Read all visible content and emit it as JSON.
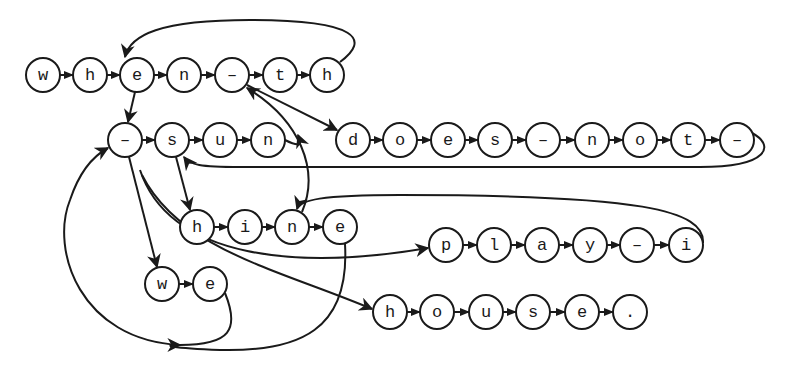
{
  "diagram": {
    "node_radius": 17,
    "colors": {
      "stroke": "#1a1a1a",
      "fill": "#ffffff",
      "background": "#ffffff"
    },
    "chains": [
      {
        "id": "chain-when-th",
        "y": 75,
        "nodes": [
          {
            "label": "w",
            "x": 43
          },
          {
            "label": "h",
            "x": 90
          },
          {
            "label": "e",
            "x": 137
          },
          {
            "label": "n",
            "x": 184
          },
          {
            "label": "-",
            "x": 232
          },
          {
            "label": "t",
            "x": 280
          },
          {
            "label": "h",
            "x": 327
          }
        ]
      },
      {
        "id": "chain-sun",
        "y": 140,
        "nodes": [
          {
            "label": "-",
            "x": 125
          },
          {
            "label": "s",
            "x": 172
          },
          {
            "label": "u",
            "x": 220
          },
          {
            "label": "n",
            "x": 268
          }
        ]
      },
      {
        "id": "chain-does-not",
        "y": 140,
        "nodes": [
          {
            "label": "d",
            "x": 353
          },
          {
            "label": "o",
            "x": 400
          },
          {
            "label": "e",
            "x": 448
          },
          {
            "label": "s",
            "x": 495
          },
          {
            "label": "-",
            "x": 543
          },
          {
            "label": "n",
            "x": 592
          },
          {
            "label": "o",
            "x": 640
          },
          {
            "label": "t",
            "x": 688
          },
          {
            "label": "-",
            "x": 737
          }
        ]
      },
      {
        "id": "chain-hine",
        "y": 227,
        "nodes": [
          {
            "label": "h",
            "x": 197
          },
          {
            "label": "i",
            "x": 245
          },
          {
            "label": "n",
            "x": 292
          },
          {
            "label": "e",
            "x": 340
          }
        ]
      },
      {
        "id": "chain-play-i",
        "y": 245,
        "nodes": [
          {
            "label": "p",
            "x": 446
          },
          {
            "label": "l",
            "x": 494
          },
          {
            "label": "a",
            "x": 542
          },
          {
            "label": "y",
            "x": 590
          },
          {
            "label": "-",
            "x": 637
          },
          {
            "label": "i",
            "x": 686
          }
        ]
      },
      {
        "id": "chain-we",
        "y": 284,
        "nodes": [
          {
            "label": "w",
            "x": 162
          },
          {
            "label": "e",
            "x": 210
          }
        ]
      },
      {
        "id": "chain-house",
        "y": 312,
        "nodes": [
          {
            "label": "h",
            "x": 390
          },
          {
            "label": "o",
            "x": 437
          },
          {
            "label": "u",
            "x": 486
          },
          {
            "label": "s",
            "x": 533
          },
          {
            "label": "e",
            "x": 582
          },
          {
            "label": ".",
            "x": 630
          }
        ]
      }
    ],
    "edges": [
      {
        "name": "edge-th-h-to-e",
        "d": "M 340 62 C 370 40, 360 20, 250 20 C 160 20, 130 35, 125 57"
      },
      {
        "name": "edge-e-to-dash-sun",
        "d": "M 135 92 L 128 122"
      },
      {
        "name": "edge-dash-to-does",
        "d": "M 247 85 L 337 130"
      },
      {
        "name": "edge-n-sun-to-dash",
        "d": "M 285 140 C 305 150, 300 140, 298 135"
      },
      {
        "name": "edge-n-hine-to-dash-th",
        "d": "M 302 212 C 320 170, 300 120, 247 88"
      },
      {
        "name": "edge-not-dash-to-s",
        "d": "M 752 133 C 775 145, 770 167, 700 167 L 240 167 C 200 167, 190 165, 184 157"
      },
      {
        "name": "edge-s-to-hine-h",
        "d": "M 176 157 L 190 210"
      },
      {
        "name": "edge-play-i-to-n",
        "d": "M 703 243 C 705 210, 640 195, 400 195 C 320 195, 300 200, 297 209"
      },
      {
        "name": "edge-dash-sun-to-we",
        "d": "M 129 157 L 157 267"
      },
      {
        "name": "edge-dash-sun-to-play",
        "d": "M 140 170 C 170 260, 300 270, 428 248"
      },
      {
        "name": "edge-dash-sun-to-house",
        "d": "M 142 175 C 180 250, 280 270, 372 309"
      },
      {
        "name": "edge-we-e-to-dash",
        "d": "M 225 293 C 240 330, 230 345, 180 345 C 80 340, 50 250, 70 200 C 80 170, 95 155, 108 148"
      },
      {
        "name": "edge-hine-e-to-dash",
        "d": "M 345 244 C 350 330, 300 352, 220 350 C 170 348, 160 345, 180 345"
      }
    ]
  }
}
